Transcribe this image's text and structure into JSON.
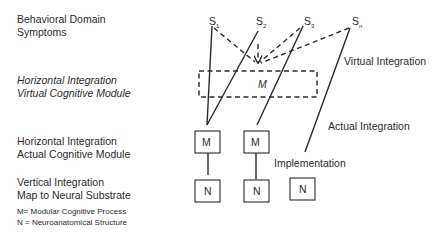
{
  "left_labels": {
    "behavioral": [
      "Behavioral Domain",
      "Symptoms"
    ],
    "horizontal_virtual": [
      "Horizontal Integration",
      "Virtual Cognitive Module"
    ],
    "horizontal_actual": [
      "Horizontal Integration",
      "Actual Cognitive Module"
    ],
    "vertical": [
      "Vertical Integration",
      "Map to Neural Substrate"
    ]
  },
  "legend": {
    "m": "M= Modular Cognitive Process",
    "n": "N = Neuroanatomical Structure"
  },
  "symptoms": [
    {
      "base": "S",
      "sub": "1"
    },
    {
      "base": "S",
      "sub": "2"
    },
    {
      "base": "S",
      "sub": "3"
    },
    {
      "base": "S",
      "sub": "n"
    }
  ],
  "virtual_module_label": "M",
  "module_boxes": [
    "M",
    "M"
  ],
  "neural_boxes": [
    "N",
    "N",
    "N"
  ],
  "annotations": {
    "virtual_integration": "Virtual Integration",
    "actual_integration": "Actual Integration",
    "implementation": "Implementation"
  }
}
